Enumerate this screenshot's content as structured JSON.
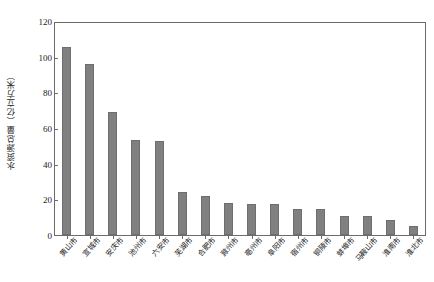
{
  "chart_data": {
    "type": "bar",
    "title": "",
    "subtitle": "",
    "xlabel": "",
    "ylabel": "水资源总量（亿立方米）",
    "ylim": [
      0,
      120
    ],
    "yticks": [
      0,
      20,
      40,
      60,
      80,
      100,
      120
    ],
    "ytick_labels": [
      "0",
      "20",
      "40",
      "60",
      "80",
      "100",
      "120"
    ],
    "grid": false,
    "legend": false,
    "legend_position": "none",
    "bar_color": "#808080",
    "frame_color": "#6b6b6b",
    "categories": [
      "黄山市",
      "宣城市",
      "安庆市",
      "池州市",
      "六安市",
      "芜湖市",
      "合肥市",
      "滁州市",
      "亳州市",
      "阜阳市",
      "宿州市",
      "铜陵市",
      "蚌埠市",
      "马鞍山市",
      "淮南市",
      "淮北市"
    ],
    "values": [
      106.5,
      97.0,
      69.5,
      53.5,
      53.0,
      24.5,
      22.0,
      18.0,
      17.5,
      17.5,
      15.0,
      14.5,
      11.0,
      11.0,
      8.5,
      5.0
    ]
  }
}
